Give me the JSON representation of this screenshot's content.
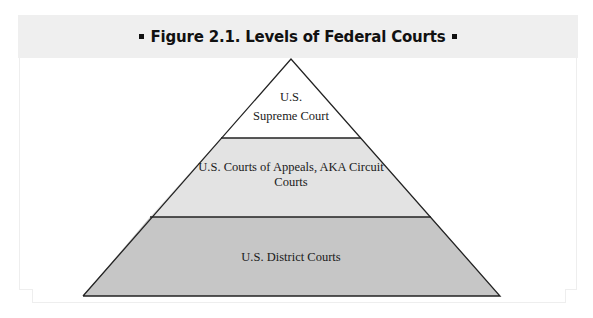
{
  "figure": {
    "title": "Figure 2.1. Levels of Federal Courts",
    "bullet_left": "▪",
    "bullet_right": "▪"
  },
  "pyramid": {
    "tiers": [
      {
        "level": "top",
        "label_line1": "U.S.",
        "label_line2": "Supreme Court",
        "fill": "#ffffff"
      },
      {
        "level": "middle",
        "label_line1": "U.S. Courts of Appeals, AKA Circuit",
        "label_line2": "Courts",
        "fill": "#e3e3e3"
      },
      {
        "level": "bottom",
        "label_line1": "U.S. District Courts",
        "fill": "#c6c6c6"
      }
    ],
    "outline_color": "#222222"
  },
  "colors": {
    "header_band": "#efefef",
    "frame": "#eeeeee",
    "text": "#1a1a1a"
  }
}
